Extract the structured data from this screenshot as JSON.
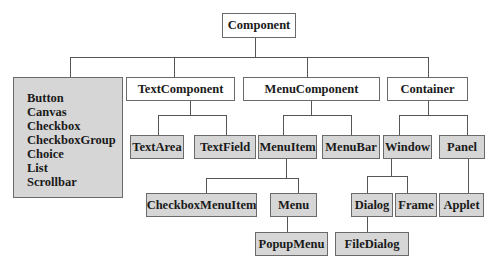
{
  "diagram": {
    "type": "class-hierarchy",
    "root": {
      "label": "Component"
    },
    "leaf_group": {
      "items": [
        "Button",
        "Canvas",
        "Checkbox",
        "CheckboxGroup",
        "Choice",
        "List",
        "Scrollbar"
      ]
    },
    "nodes": {
      "textcomponent": "TextComponent",
      "menucomponent": "MenuComponent",
      "container": "Container",
      "textarea": "TextArea",
      "textfield": "TextField",
      "menuitem": "MenuItem",
      "menubar": "MenuBar",
      "window": "Window",
      "panel": "Panel",
      "checkboxmenuitem": "CheckboxMenuItem",
      "menu": "Menu",
      "popupmenu": "PopupMenu",
      "dialog": "Dialog",
      "frame": "Frame",
      "applet": "Applet",
      "filedialog": "FileDialog"
    },
    "edges": [
      [
        "Component",
        "LeafGroup"
      ],
      [
        "Component",
        "TextComponent"
      ],
      [
        "Component",
        "MenuComponent"
      ],
      [
        "Component",
        "Container"
      ],
      [
        "TextComponent",
        "TextArea"
      ],
      [
        "TextComponent",
        "TextField"
      ],
      [
        "MenuComponent",
        "MenuItem"
      ],
      [
        "MenuComponent",
        "MenuBar"
      ],
      [
        "Container",
        "Window"
      ],
      [
        "Container",
        "Panel"
      ],
      [
        "MenuItem",
        "CheckboxMenuItem"
      ],
      [
        "MenuItem",
        "Menu"
      ],
      [
        "Menu",
        "PopupMenu"
      ],
      [
        "Window",
        "Dialog"
      ],
      [
        "Window",
        "Frame"
      ],
      [
        "Panel",
        "Applet"
      ],
      [
        "Dialog",
        "FileDialog"
      ]
    ],
    "colors": {
      "abstract_fill": "#ffffff",
      "concrete_fill": "#d6d6d6",
      "border": "#6a6a6a",
      "line": "#555555"
    }
  }
}
